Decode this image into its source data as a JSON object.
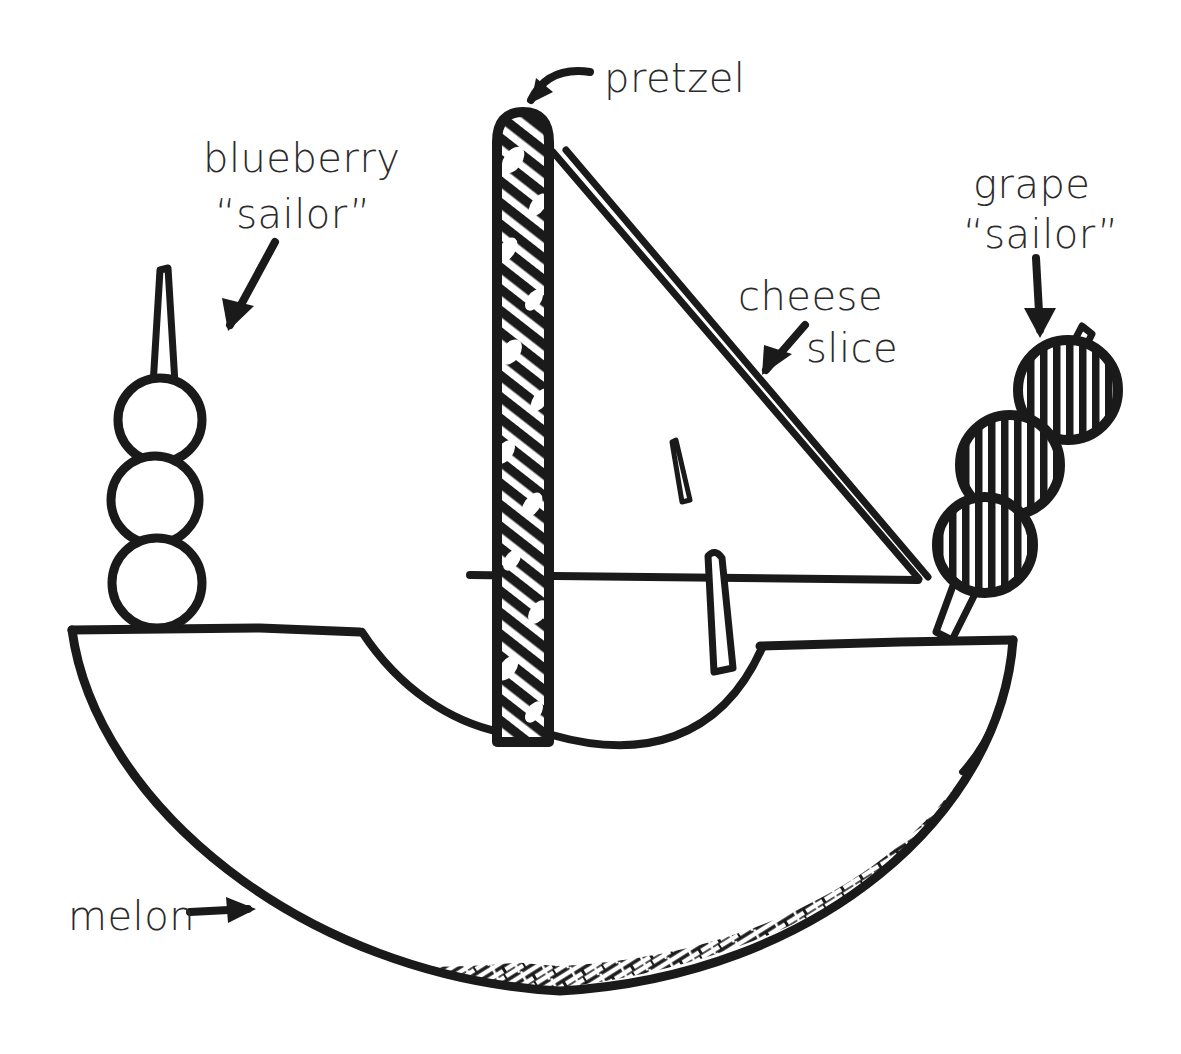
{
  "illustration": {
    "title": "Fruit sailboat snack diagram",
    "style": "hand-drawn black ink line art on white",
    "ink_color": "#1a1a1a",
    "text_color": "#2b2b2b",
    "background_color": "#ffffff",
    "width": 1181,
    "height": 1054
  },
  "labels": {
    "pretzel": {
      "line1": "pretzel",
      "x": 604,
      "y": 92,
      "font_size": 40,
      "arrow": "curved-arrow-down-left",
      "points_to": "mast"
    },
    "blueberry": {
      "line1": "blueberry",
      "line2": "“sailor”",
      "x": 203,
      "y": 172,
      "x2": 215,
      "y2": 228,
      "font_size": 40,
      "arrow": "straight-arrow-down-left",
      "points_to": "blueberry-skewer"
    },
    "grape": {
      "line1": "grape",
      "line2": "“sailor”",
      "x": 973,
      "y": 198,
      "x2": 963,
      "y2": 248,
      "font_size": 40,
      "arrow": "straight-arrow-down",
      "points_to": "grape-skewer"
    },
    "cheese": {
      "line1": "cheese",
      "line2": "slice",
      "x": 738,
      "y": 310,
      "x2": 806,
      "y2": 362,
      "font_size": 40,
      "arrow": "straight-arrow-down-left",
      "points_to": "sail"
    },
    "melon": {
      "line1": "melon",
      "x": 68,
      "y": 930,
      "font_size": 40,
      "arrow": "straight-arrow-right",
      "points_to": "hull"
    }
  },
  "components": {
    "mast": {
      "name": "pretzel-stick-mast",
      "texture": "diagonal-hatch-with-salt-specks",
      "top_y": 112,
      "bottom_y": 742,
      "center_x": 523,
      "width": 52
    },
    "sail": {
      "name": "cheese-slice-sail",
      "shape": "right-triangle",
      "fill": "white",
      "apex": [
        552,
        150
      ],
      "bottom_left": [
        552,
        578
      ],
      "bottom_right": [
        918,
        578
      ],
      "has_hole_mark": true
    },
    "boom": {
      "name": "boom-line",
      "y": 578,
      "x_start": 470,
      "x_end": 918
    },
    "toothpick_center": {
      "name": "center-toothpick",
      "x": 715,
      "top_y": 552,
      "bottom_y": 672
    },
    "hull": {
      "name": "melon-wedge-hull",
      "fill": "white",
      "rind_texture": "dark-hatched-band",
      "deck_left": [
        72,
        630
      ],
      "deck_right": [
        1013,
        640
      ],
      "lowest_point": [
        560,
        990
      ]
    },
    "blueberry_skewer": {
      "name": "blueberry-skewer",
      "berry_count": 3,
      "berry_fill": "white",
      "toothpick_tip_y": 265,
      "berries": [
        {
          "cx": 160,
          "cy": 420,
          "r": 42
        },
        {
          "cx": 155,
          "cy": 500,
          "r": 44
        },
        {
          "cx": 157,
          "cy": 583,
          "r": 45
        }
      ]
    },
    "grape_skewer": {
      "name": "grape-skewer",
      "grape_count": 3,
      "grape_fill": "vertical-hatch",
      "orientation": "diagonal",
      "grapes": [
        {
          "cx": 1068,
          "cy": 390,
          "r": 50
        },
        {
          "cx": 1010,
          "cy": 465,
          "r": 50
        },
        {
          "cx": 985,
          "cy": 545,
          "r": 48
        }
      ]
    }
  }
}
